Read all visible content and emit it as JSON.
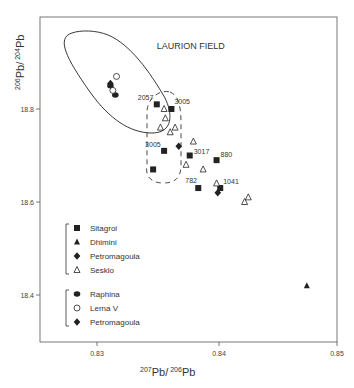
{
  "chart_data": {
    "type": "scatter",
    "title": "",
    "xlabel": "207Pb/206Pb",
    "ylabel": "206Pb/204Pb",
    "xlabel_parts": {
      "sup1": "207",
      "base1": "Pb/",
      "sup2": "206",
      "base2": "Pb"
    },
    "ylabel_parts": {
      "sup1": "206",
      "base1": "Pb/",
      "sup2": "204",
      "base2": "Pb"
    },
    "xlim": [
      0.8253,
      0.8497
    ],
    "ylim": [
      18.3,
      19.0
    ],
    "x_ticks": [
      {
        "value": 0.83,
        "label": "0.83"
      },
      {
        "value": 0.84,
        "label": "0.84"
      },
      {
        "value": 0.85,
        "label": "0.85"
      }
    ],
    "y_ticks": [
      {
        "value": 18.8,
        "label": "18.8"
      },
      {
        "value": 18.6,
        "label": "18.6"
      },
      {
        "value": 18.4,
        "label": "18.4"
      }
    ],
    "grid": false,
    "annotations": [
      {
        "text": "LAURION FIELD",
        "x": 0.8349,
        "y": 18.93
      }
    ],
    "series": [
      {
        "name": "Sitagroi",
        "marker": "square-filled",
        "group": 1,
        "points": [
          {
            "x": 0.8349,
            "y": 18.81,
            "label": "2057"
          },
          {
            "x": 0.8361,
            "y": 18.8,
            "label": "3005"
          },
          {
            "x": 0.8355,
            "y": 18.71,
            "label": "3005"
          },
          {
            "x": 0.8346,
            "y": 18.67,
            "label": ""
          },
          {
            "x": 0.8376,
            "y": 18.7,
            "label": "3017"
          },
          {
            "x": 0.8398,
            "y": 18.69,
            "label": "880"
          },
          {
            "x": 0.8383,
            "y": 18.63,
            "label": "782"
          },
          {
            "x": 0.8401,
            "y": 18.63,
            "label": "1041"
          }
        ]
      },
      {
        "name": "Dhimini",
        "marker": "triangle-filled",
        "group": 1,
        "points": [
          {
            "x": 0.8472,
            "y": 18.42,
            "label": ""
          }
        ]
      },
      {
        "name": "Petromagoula",
        "marker": "diamond-filled",
        "group": 1,
        "points": [
          {
            "x": 0.8367,
            "y": 18.72,
            "label": ""
          },
          {
            "x": 0.8399,
            "y": 18.62,
            "label": ""
          }
        ]
      },
      {
        "name": "Sesklo",
        "marker": "triangle-open",
        "group": 1,
        "points": [
          {
            "x": 0.8355,
            "y": 18.8,
            "label": ""
          },
          {
            "x": 0.8356,
            "y": 18.78,
            "label": ""
          },
          {
            "x": 0.8352,
            "y": 18.76,
            "label": ""
          },
          {
            "x": 0.8364,
            "y": 18.76,
            "label": ""
          },
          {
            "x": 0.836,
            "y": 18.75,
            "label": ""
          },
          {
            "x": 0.8379,
            "y": 18.73,
            "label": ""
          },
          {
            "x": 0.8373,
            "y": 18.68,
            "label": ""
          },
          {
            "x": 0.8387,
            "y": 18.67,
            "label": ""
          },
          {
            "x": 0.8398,
            "y": 18.64,
            "label": ""
          },
          {
            "x": 0.8424,
            "y": 18.61,
            "label": ""
          },
          {
            "x": 0.8421,
            "y": 18.6,
            "label": ""
          }
        ]
      },
      {
        "name": "Raphina",
        "marker": "circle-filled",
        "group": 2,
        "points": [
          {
            "x": 0.8311,
            "y": 18.85,
            "label": ""
          },
          {
            "x": 0.8315,
            "y": 18.83,
            "label": ""
          }
        ]
      },
      {
        "name": "Lerna V",
        "marker": "circle-open",
        "group": 2,
        "points": [
          {
            "x": 0.8316,
            "y": 18.87,
            "label": ""
          },
          {
            "x": 0.8313,
            "y": 18.84,
            "label": ""
          }
        ]
      },
      {
        "name": "Petromagoula",
        "marker": "diamond-filled",
        "group": 2,
        "points": [
          {
            "x": 0.8311,
            "y": 18.855,
            "label": ""
          }
        ]
      }
    ],
    "legend_position": "lower-left",
    "legend": [
      {
        "group": 1,
        "items": [
          {
            "marker": "square-filled",
            "label": "Sitagroi"
          },
          {
            "marker": "triangle-filled",
            "label": "Dhimini"
          },
          {
            "marker": "diamond-filled",
            "label": "Petromagoula"
          },
          {
            "marker": "triangle-open",
            "label": "Sesklo"
          }
        ]
      },
      {
        "group": 2,
        "items": [
          {
            "marker": "circle-filled",
            "label": "Raphina"
          },
          {
            "marker": "circle-open",
            "label": "Lerna V"
          },
          {
            "marker": "diamond-filled",
            "label": "Petromagoula"
          }
        ]
      }
    ]
  },
  "colors": {
    "ink": "#222222",
    "axis": "#555555",
    "background": "#ffffff"
  }
}
